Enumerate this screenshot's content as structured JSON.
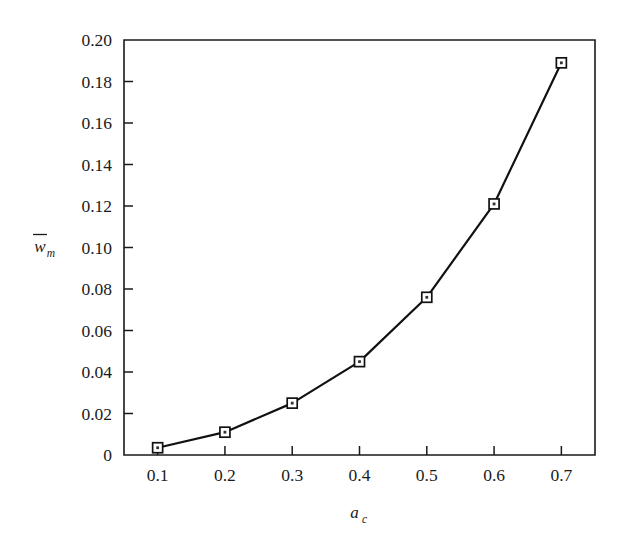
{
  "chart_data": {
    "type": "line",
    "title": "",
    "subtitle": "",
    "xlabel": "a_c",
    "xlabel_base": "a",
    "xlabel_sub": "c",
    "ylabel": "w̄_m",
    "ylabel_base": "w",
    "ylabel_sub": "m",
    "ylabel_has_overbar": true,
    "x": [
      0.1,
      0.2,
      0.3,
      0.4,
      0.5,
      0.6,
      0.7
    ],
    "values": [
      0.0035,
      0.011,
      0.025,
      0.045,
      0.076,
      0.121,
      0.189
    ],
    "series": [
      {
        "name": "w_m vs a_c",
        "values": [
          0.0035,
          0.011,
          0.025,
          0.045,
          0.076,
          0.121,
          0.189
        ]
      }
    ],
    "xlim": [
      0.05,
      0.75
    ],
    "ylim": [
      0.0,
      0.2
    ],
    "xticks": [
      0.1,
      0.2,
      0.3,
      0.4,
      0.5,
      0.6,
      0.7
    ],
    "xtick_labels": [
      "0.1",
      "0.2",
      "0.3",
      "0.4",
      "0.5",
      "0.6",
      "0.7"
    ],
    "yticks": [
      0.0,
      0.02,
      0.04,
      0.06,
      0.08,
      0.1,
      0.12,
      0.14,
      0.16,
      0.18,
      0.2
    ],
    "ytick_labels": [
      "0",
      "0.02",
      "0.04",
      "0.06",
      "0.08",
      "0.10",
      "0.12",
      "0.14",
      "0.16",
      "0.18",
      "0.20"
    ],
    "grid": false,
    "legend": null,
    "legend_position": "none",
    "marker": "open-square",
    "line_color": "#111111",
    "marker_face_color": "#ffffff",
    "marker_edge_color": "#111111",
    "background_color": "#ffffff",
    "annotations": []
  }
}
